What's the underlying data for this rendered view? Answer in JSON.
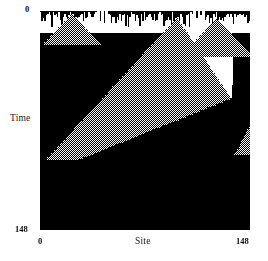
{
  "figure": {
    "kind": "cellular-automaton-spacetime-diagram",
    "background_color": "#ffffff",
    "plot": {
      "left": 40,
      "top": 11,
      "width": 210,
      "height": 219,
      "cell_color_background": "#ffffff",
      "cell_color_black": "#000000",
      "cell_color_gray_dither": "#000000"
    }
  },
  "axes": {
    "y": {
      "label": "Time",
      "ticks": [
        "0",
        "148"
      ],
      "min": 0,
      "max": 148,
      "direction": "top-to-bottom"
    },
    "x": {
      "label": "Site",
      "ticks": [
        "0",
        "148"
      ],
      "min": 0,
      "max": 148,
      "direction": "left-to-right"
    }
  },
  "chart_data": {
    "type": "heatmap",
    "title": "",
    "xlabel": "Site",
    "ylabel": "Time",
    "xlim": [
      0,
      148
    ],
    "ylim": [
      148,
      0
    ],
    "grid": false,
    "legend": null,
    "states": [
      "white",
      "gray-dither",
      "black"
    ],
    "regions": [
      {
        "name": "top-chaotic-band",
        "state": "mixed-white-black",
        "site_range": [
          0,
          148
        ],
        "time_range": [
          0,
          12
        ]
      },
      {
        "name": "left-gray-triangle",
        "state": "gray-dither",
        "apex_site": 22,
        "apex_time": 2,
        "base_time": 22,
        "base_site_range": [
          2,
          44
        ]
      },
      {
        "name": "main-large-gray-triangle",
        "state": "gray-dither",
        "apex_site": 96,
        "apex_time": 4,
        "left_edge_end_site": 2,
        "left_edge_end_time": 100,
        "right_edge_end_site": 136,
        "right_edge_end_time": 58
      },
      {
        "name": "center-right-gray-triangle",
        "state": "gray-dither",
        "apex_site": 124,
        "apex_time": 5,
        "base_time": 30,
        "base_site_range": [
          100,
          148
        ]
      },
      {
        "name": "white-wedge-right",
        "state": "white",
        "apex_site": 136,
        "apex_time": 58,
        "top_site_range": [
          96,
          148
        ],
        "top_time": 4
      },
      {
        "name": "small-gray-triangle-right",
        "state": "gray-dither",
        "apex_site": 148,
        "apex_time": 76,
        "base_time": 96,
        "base_site_range": [
          138,
          148
        ]
      },
      {
        "name": "lower-black-field",
        "state": "black",
        "site_range": [
          0,
          148
        ],
        "time_range": [
          100,
          148
        ]
      }
    ]
  }
}
